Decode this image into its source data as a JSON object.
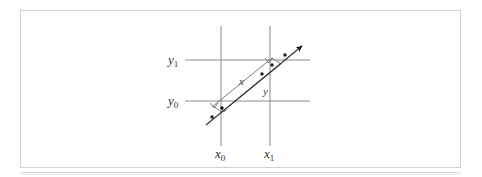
{
  "figure": {
    "domain": "diagram",
    "background_color": "#ffffff",
    "frame_color": "#d2d2d2",
    "gridline_color": "#8a8a8a",
    "ray_color": "#2e2e2e",
    "strip_color": "#6e6e6e"
  },
  "labels": {
    "y_top": {
      "base": "y",
      "sub": "1"
    },
    "y_bottom": {
      "base": "y",
      "sub": "0"
    },
    "x_left": {
      "base": "x",
      "sub": "0"
    },
    "x_right": {
      "base": "x",
      "sub": "1"
    },
    "segment_upper": "x",
    "segment_lower": "y"
  },
  "geometry": {
    "vertical_lines": [
      {
        "name": "x0",
        "x": 221,
        "y_top": 26,
        "y_bottom": 146
      },
      {
        "name": "x1",
        "x": 270,
        "y_top": 26,
        "y_bottom": 146
      }
    ],
    "horizontal_lines": [
      {
        "name": "y1",
        "y": 60,
        "x_left": 185,
        "x_right": 310
      },
      {
        "name": "y0",
        "y": 101,
        "x_left": 185,
        "x_right": 310
      }
    ],
    "ray": {
      "x1": 206,
      "y1": 125,
      "x2": 305,
      "y2": 44,
      "arrow_at": "end"
    },
    "strip": {
      "note": "narrow parallelogram straddling the ray",
      "p1": [
        213,
        106
      ],
      "p2": [
        272,
        58
      ],
      "p3": [
        281,
        64
      ],
      "p4": [
        222,
        112
      ]
    },
    "dots": [
      [
        212,
        117
      ],
      [
        222,
        108
      ],
      [
        262,
        74
      ],
      [
        272,
        65
      ],
      [
        285,
        55
      ]
    ],
    "right_angle_marks": [
      {
        "at": [
          215,
          104
        ],
        "label": "upper-left corner"
      },
      {
        "at": [
          224,
          110
        ],
        "label": "lower-left corner"
      },
      {
        "at": [
          268,
          61
        ],
        "label": "upper-right corner"
      }
    ]
  }
}
